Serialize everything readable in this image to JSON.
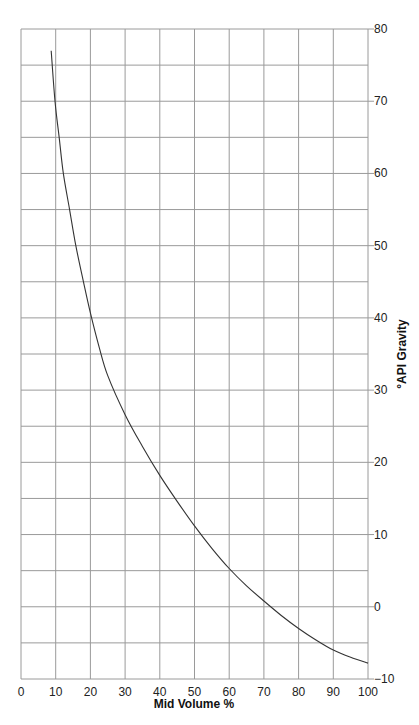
{
  "chart_data": {
    "type": "line",
    "title": "",
    "xlabel": "Mid Volume %",
    "ylabel": "°API Gravity",
    "xlim": [
      0,
      100
    ],
    "ylim": [
      -10,
      80
    ],
    "x_ticks": [
      0,
      10,
      20,
      30,
      40,
      50,
      60,
      70,
      80,
      90,
      100
    ],
    "y_ticks": [
      -10,
      0,
      10,
      20,
      30,
      40,
      50,
      60,
      70,
      80
    ],
    "y_tick_labels": [
      "−10",
      "0",
      "10",
      "20",
      "30",
      "40",
      "50",
      "60",
      "70",
      "80"
    ],
    "y_axis_position": "right",
    "grid": {
      "on": true,
      "x_step": 10,
      "y_step": 5
    },
    "legend": null,
    "series": [
      {
        "name": "API Gravity vs Mid Volume %",
        "color": "#333333",
        "x": [
          8.7,
          9.8,
          11,
          12.2,
          14,
          15.8,
          18,
          20,
          22.5,
          25,
          30,
          35,
          40,
          45,
          50,
          55,
          60,
          65,
          70,
          75,
          80,
          85,
          90,
          95,
          100
        ],
        "y": [
          77,
          70,
          65,
          60,
          55,
          50,
          45,
          40.7,
          36,
          32,
          26.6,
          22.2,
          18.2,
          14.6,
          11.2,
          8.1,
          5.3,
          2.9,
          0.8,
          -1.2,
          -3.0,
          -4.6,
          -6.0,
          -7.0,
          -7.8
        ]
      }
    ]
  },
  "colors": {
    "grid": "#9a9a9a",
    "curve": "#333333",
    "background": "#ffffff"
  }
}
